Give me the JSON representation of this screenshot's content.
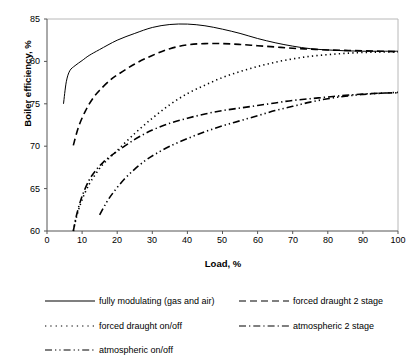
{
  "chart_data": {
    "type": "line",
    "title": "",
    "xlabel": "Load, %",
    "ylabel": "Boiler efficiency, %",
    "xlim": [
      0,
      100
    ],
    "ylim": [
      60,
      85
    ],
    "xticks": [
      0,
      10,
      20,
      30,
      40,
      50,
      60,
      70,
      80,
      90,
      100
    ],
    "yticks": [
      60,
      65,
      70,
      75,
      80,
      85
    ],
    "grid": false,
    "legend_position": "bottom",
    "series": [
      {
        "name": "fully modulating (gas and air)",
        "style": "solid",
        "color": "#000000",
        "x": [
          4.7,
          5.5,
          6.5,
          8,
          10,
          12,
          15,
          20,
          25,
          30,
          35,
          40,
          45,
          50,
          55,
          60,
          65,
          70,
          75,
          80,
          85,
          90,
          95,
          100
        ],
        "y": [
          75.0,
          77.6,
          78.9,
          79.5,
          80.1,
          80.7,
          81.4,
          82.5,
          83.3,
          84.0,
          84.35,
          84.4,
          84.2,
          83.8,
          83.3,
          82.7,
          82.2,
          81.8,
          81.5,
          81.35,
          81.25,
          81.2,
          81.2,
          81.2
        ]
      },
      {
        "name": "forced draught 2 stage",
        "style": "dashed",
        "color": "#000000",
        "x": [
          7.5,
          9,
          11,
          13,
          15,
          18,
          20,
          25,
          30,
          35,
          40,
          45,
          50,
          55,
          60,
          65,
          70,
          75,
          80,
          85,
          90,
          95,
          100
        ],
        "y": [
          70.1,
          72.3,
          74.2,
          75.6,
          76.6,
          77.8,
          78.4,
          79.7,
          80.7,
          81.5,
          81.95,
          82.1,
          82.1,
          82.0,
          81.85,
          81.7,
          81.55,
          81.45,
          81.35,
          81.3,
          81.25,
          81.2,
          81.15
        ]
      },
      {
        "name": "forced draught on/off",
        "style": "dotted",
        "color": "#000000",
        "x": [
          7.5,
          8.5,
          10,
          12,
          14,
          16,
          18,
          20,
          25,
          30,
          35,
          40,
          45,
          50,
          55,
          60,
          65,
          70,
          75,
          80,
          85,
          90,
          95,
          100
        ],
        "y": [
          60.0,
          61.8,
          63.7,
          65.5,
          66.8,
          67.9,
          68.7,
          69.5,
          71.5,
          73.3,
          74.9,
          76.2,
          77.2,
          78.1,
          78.8,
          79.4,
          79.9,
          80.3,
          80.6,
          80.8,
          80.95,
          81.05,
          81.1,
          81.1
        ]
      },
      {
        "name": "atmospheric 2 stage",
        "style": "dashdot",
        "color": "#000000",
        "x": [
          7.5,
          8.5,
          10,
          12,
          14,
          16,
          18,
          20,
          25,
          30,
          35,
          40,
          45,
          50,
          55,
          60,
          65,
          70,
          75,
          80,
          85,
          90,
          95,
          100
        ],
        "y": [
          60.0,
          62.0,
          64.1,
          66.0,
          67.2,
          68.1,
          68.8,
          69.4,
          70.8,
          71.9,
          72.7,
          73.3,
          73.8,
          74.2,
          74.5,
          74.8,
          75.1,
          75.4,
          75.6,
          75.8,
          76.0,
          76.15,
          76.25,
          76.3
        ]
      },
      {
        "name": "atmospheric on/off",
        "style": "dashdotdot",
        "color": "#000000",
        "x": [
          15,
          17,
          19,
          22,
          25,
          28,
          31,
          35,
          40,
          45,
          50,
          55,
          60,
          65,
          70,
          75,
          80,
          85,
          90,
          95,
          100
        ],
        "y": [
          61.9,
          63.4,
          64.6,
          66.1,
          67.3,
          68.3,
          69.1,
          70.0,
          70.9,
          71.7,
          72.4,
          73.0,
          73.6,
          74.2,
          74.7,
          75.2,
          75.6,
          75.9,
          76.1,
          76.25,
          76.35
        ]
      }
    ]
  },
  "axes": {
    "ylabel": "Boiler efficiency, %",
    "xlabel": "Load, %",
    "ytick_labels": [
      "85",
      "80",
      "75",
      "70",
      "65",
      "60"
    ],
    "xtick_labels": [
      "0",
      "10",
      "20",
      "30",
      "40",
      "50",
      "60",
      "70",
      "80",
      "90",
      "100"
    ]
  },
  "legend": {
    "entries": [
      {
        "label": "fully modulating (gas and air)",
        "style": "solid"
      },
      {
        "label": "forced draught 2 stage",
        "style": "dashed"
      },
      {
        "label": "forced draught on/off",
        "style": "dotted"
      },
      {
        "label": "atmospheric 2 stage",
        "style": "dashdot"
      },
      {
        "label": "atmospheric on/off",
        "style": "dashdotdot"
      }
    ]
  }
}
